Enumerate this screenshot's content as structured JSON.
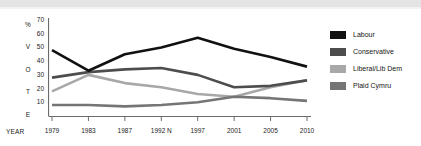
{
  "chart_data": {
    "type": "line",
    "title": "",
    "xlabel": "YEAR",
    "ylabel": "% VOTE",
    "ylim": [
      0,
      70
    ],
    "yticks": [
      10,
      20,
      30,
      40,
      50,
      60,
      70
    ],
    "grid": false,
    "legend_position": "right",
    "categories": [
      "1979",
      "1983",
      "1987",
      "1992 N",
      "1997",
      "2001",
      "2005",
      "2010"
    ],
    "series": [
      {
        "name": "Labour",
        "color": "#111111",
        "values": [
          48,
          33,
          45,
          50,
          57,
          49,
          43,
          36
        ]
      },
      {
        "name": "Conservative",
        "color": "#4d4d4d",
        "values": [
          28,
          32,
          34,
          35,
          30,
          21,
          22,
          26
        ]
      },
      {
        "name": "Liberal/Lib Dem",
        "color": "#a8a8a8",
        "values": [
          18,
          30,
          24,
          21,
          16,
          14,
          21,
          26
        ]
      },
      {
        "name": "Plaid Cymru",
        "color": "#757575",
        "values": [
          8,
          8,
          7,
          8,
          10,
          14,
          13,
          11
        ]
      }
    ]
  },
  "axes": {
    "y_title_letters": [
      "%",
      "V",
      "O",
      "T",
      "E"
    ],
    "y_tick_labels": [
      "70",
      "60",
      "50",
      "40",
      "30",
      "20",
      "10"
    ],
    "x_title": "YEAR",
    "x_tick_labels": [
      "1979",
      "1983",
      "1987",
      "1992 N",
      "1997",
      "2001",
      "2005",
      "2010"
    ]
  },
  "legend": {
    "items": [
      {
        "label": "Labour",
        "color": "#111111"
      },
      {
        "label": "Conservative",
        "color": "#4d4d4d"
      },
      {
        "label": "Liberal/Lib Dem",
        "color": "#a8a8a8"
      },
      {
        "label": "Plaid Cymru",
        "color": "#757575"
      }
    ]
  },
  "style": {
    "background": "#ffffff",
    "axis_color": "#6b6b6b",
    "band_color": "#e4e4e4",
    "text_color": "#1a1a1a"
  }
}
